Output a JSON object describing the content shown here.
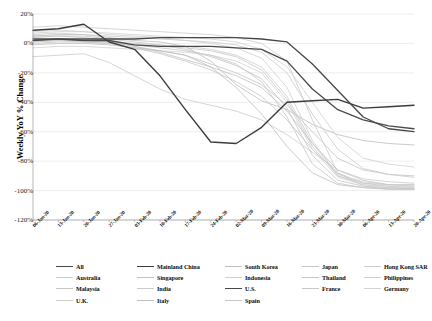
{
  "chart_data": {
    "type": "line",
    "title": "",
    "subtitle": "",
    "xlabel": "",
    "ylabel": "Weekly YoY % Change",
    "ylim": [
      -120,
      20
    ],
    "ytick_values": [
      20,
      0,
      -20,
      -40,
      -60,
      -80,
      -100,
      -120
    ],
    "ytick_labels": [
      "20%",
      "0%",
      "-20%",
      "-40%",
      "-60%",
      "-80%",
      "-100%",
      "-120%"
    ],
    "grid": true,
    "legend_position": "bottom",
    "legend_columns": 5,
    "x": [
      "06-Jan-20",
      "13-Jan-20",
      "20-Jan-20",
      "27-Jan-20",
      "03-Feb-20",
      "10-Feb-20",
      "17-Feb-20",
      "24-Feb-20",
      "02-Mar-20",
      "09-Mar-20",
      "16-Mar-20",
      "23-Mar-20",
      "30-Mar-20",
      "06-Apr-20",
      "13-Apr-20",
      "20-Apr-20"
    ],
    "series": [
      {
        "name": "All",
        "emphasis": "strong",
        "color": "#4a4a4a",
        "width": 1.3,
        "values": [
          3,
          3,
          2,
          2,
          -1,
          -2,
          -2,
          -2,
          -3,
          -4,
          -12,
          -31,
          -45,
          -52,
          -56,
          -58
        ]
      },
      {
        "name": "Mainland China",
        "emphasis": "strong",
        "color": "#3c3c3c",
        "width": 1.4,
        "values": [
          9,
          10,
          13,
          1,
          -4,
          -22,
          -45,
          -67,
          -68,
          -57,
          -40,
          -39,
          -38,
          -44,
          -43,
          -42
        ]
      },
      {
        "name": "South Korea",
        "emphasis": "light",
        "color": "#bdbdbd",
        "width": 0.8,
        "values": [
          5,
          6,
          6,
          4,
          2,
          1,
          -2,
          -12,
          -28,
          -39,
          -45,
          -55,
          -62,
          -66,
          -68,
          -69
        ]
      },
      {
        "name": "Japan",
        "emphasis": "light",
        "color": "#c4c4c4",
        "width": 0.8,
        "values": [
          2,
          3,
          2,
          1,
          -2,
          -5,
          -8,
          -14,
          -20,
          -28,
          -42,
          -60,
          -78,
          -86,
          -89,
          -90
        ]
      },
      {
        "name": "Hong Kong SAR",
        "emphasis": "light",
        "color": "#cccccc",
        "width": 0.8,
        "values": [
          -9,
          -8,
          -7,
          -13,
          -22,
          -31,
          -38,
          -42,
          -46,
          -52,
          -62,
          -74,
          -86,
          -92,
          -94,
          -95
        ]
      },
      {
        "name": "Australia",
        "emphasis": "light",
        "color": "#c9c9c9",
        "width": 0.8,
        "values": [
          6,
          7,
          6,
          5,
          4,
          3,
          2,
          1,
          -1,
          -6,
          -20,
          -48,
          -72,
          -85,
          -89,
          -91
        ]
      },
      {
        "name": "Singapore",
        "emphasis": "light",
        "color": "#c2c2c2",
        "width": 0.8,
        "values": [
          4,
          5,
          4,
          2,
          -2,
          -6,
          -11,
          -16,
          -22,
          -30,
          -46,
          -68,
          -86,
          -93,
          -96,
          -97
        ]
      },
      {
        "name": "Indonesia",
        "emphasis": "light",
        "color": "#d0d0d0",
        "width": 0.8,
        "values": [
          8,
          9,
          8,
          7,
          6,
          5,
          4,
          3,
          1,
          -4,
          -16,
          -40,
          -64,
          -78,
          -82,
          -84
        ]
      },
      {
        "name": "Thailand",
        "emphasis": "light",
        "color": "#c6c6c6",
        "width": 0.8,
        "values": [
          1,
          2,
          1,
          0,
          -3,
          -7,
          -12,
          -18,
          -26,
          -36,
          -52,
          -72,
          -88,
          -95,
          -97,
          -98
        ]
      },
      {
        "name": "Philippines",
        "emphasis": "light",
        "color": "#cfcfcf",
        "width": 0.8,
        "values": [
          7,
          8,
          8,
          6,
          5,
          4,
          2,
          0,
          -3,
          -10,
          -30,
          -66,
          -90,
          -96,
          -98,
          -98
        ]
      },
      {
        "name": "Malaysia",
        "emphasis": "light",
        "color": "#c5c5c5",
        "width": 0.8,
        "values": [
          5,
          5,
          5,
          3,
          1,
          -1,
          -4,
          -9,
          -15,
          -24,
          -44,
          -76,
          -93,
          -97,
          -98,
          -99
        ]
      },
      {
        "name": "India",
        "emphasis": "light",
        "color": "#cbcbcb",
        "width": 0.8,
        "values": [
          11,
          12,
          11,
          10,
          9,
          8,
          7,
          6,
          4,
          0,
          -12,
          -52,
          -88,
          -97,
          -99,
          -99
        ]
      },
      {
        "name": "U.S.",
        "emphasis": "strong",
        "color": "#474747",
        "width": 1.3,
        "values": [
          2,
          3,
          3,
          3,
          3,
          4,
          4,
          4,
          4,
          3,
          1,
          -14,
          -32,
          -50,
          -58,
          -60
        ]
      },
      {
        "name": "France",
        "emphasis": "light",
        "color": "#c8c8c8",
        "width": 0.8,
        "values": [
          0,
          1,
          1,
          0,
          -1,
          -2,
          -3,
          -5,
          -9,
          -18,
          -38,
          -70,
          -90,
          -95,
          -96,
          -96
        ]
      },
      {
        "name": "Germany",
        "emphasis": "light",
        "color": "#d2d2d2",
        "width": 0.8,
        "values": [
          -3,
          -2,
          -2,
          -3,
          -4,
          -5,
          -6,
          -8,
          -12,
          -20,
          -40,
          -72,
          -91,
          -96,
          -97,
          -97
        ]
      },
      {
        "name": "U.K.",
        "emphasis": "light",
        "color": "#cdcdcd",
        "width": 0.8,
        "values": [
          1,
          2,
          2,
          1,
          0,
          -1,
          -2,
          -4,
          -8,
          -16,
          -36,
          -68,
          -89,
          -94,
          -96,
          -96
        ]
      },
      {
        "name": "Italy",
        "emphasis": "light",
        "color": "#c0c0c0",
        "width": 0.8,
        "values": [
          -1,
          0,
          0,
          -1,
          -3,
          -5,
          -8,
          -16,
          -30,
          -48,
          -70,
          -88,
          -96,
          -98,
          -99,
          -99
        ]
      },
      {
        "name": "Spain",
        "emphasis": "light",
        "color": "#c7c7c7",
        "width": 0.8,
        "values": [
          2,
          3,
          2,
          1,
          -1,
          -3,
          -5,
          -8,
          -14,
          -26,
          -50,
          -82,
          -95,
          -98,
          -99,
          -99
        ]
      }
    ]
  },
  "plot": {
    "left": 33,
    "top": 14,
    "right": 414,
    "bottom": 220,
    "bg": "#ffffff",
    "grid_color": "#e3e3e3",
    "axis_color": "#9a9a9a"
  }
}
